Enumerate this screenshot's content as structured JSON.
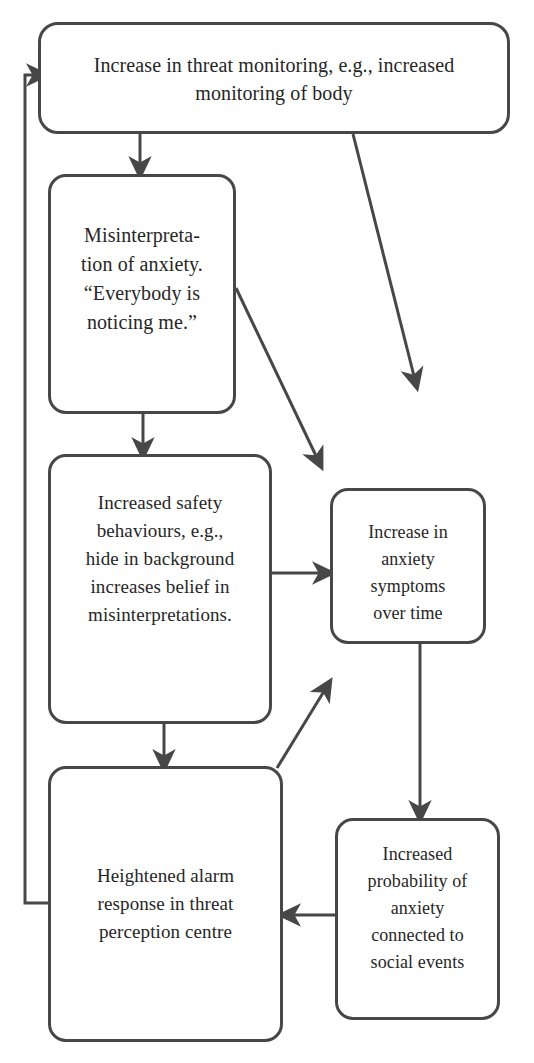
{
  "diagram": {
    "type": "flowchart",
    "line_color": "#474747",
    "text_color": "#262626",
    "background_color": "#ffffff",
    "nodes": [
      {
        "id": "threat-monitoring",
        "label": "Increase in threat monitoring, e.g., increased\nmonitoring of body"
      },
      {
        "id": "misinterpretation",
        "label": "Misinterpreta-\ntion of anxiety.\n“Everybody is\nnoticing me.”"
      },
      {
        "id": "safety-behaviours",
        "label": "Increased safety\nbehaviours, e.g.,\nhide in background\nincreases belief in\nmisinterpretations."
      },
      {
        "id": "anxiety-symptoms",
        "label": "Increase in\nanxiety\nsymptoms\nover time"
      },
      {
        "id": "alarm-response",
        "label": "Heightened alarm\nresponse in threat\nperception centre"
      },
      {
        "id": "anxiety-probability",
        "label": "Increased\nprobability of\nanxiety\nconnected to\nsocial events"
      }
    ],
    "edges": [
      {
        "id": "edge-threat-to-misinterpretation",
        "from": "threat-monitoring",
        "to": "misinterpretation",
        "style": "straight-down"
      },
      {
        "id": "edge-threat-to-diagonal",
        "from": "threat-monitoring",
        "to": "anxiety-symptoms",
        "style": "diagonal-down-right"
      },
      {
        "id": "edge-misinterpretation-to-safety",
        "from": "misinterpretation",
        "to": "safety-behaviours",
        "style": "straight-down"
      },
      {
        "id": "edge-misinterpretation-to-diagonal",
        "from": "misinterpretation",
        "to": "safety-behaviours",
        "style": "diagonal-down-right"
      },
      {
        "id": "edge-safety-to-anxiety-symptoms",
        "from": "safety-behaviours",
        "to": "anxiety-symptoms",
        "style": "straight-right"
      },
      {
        "id": "edge-safety-to-alarm",
        "from": "safety-behaviours",
        "to": "alarm-response",
        "style": "straight-down"
      },
      {
        "id": "edge-anxiety-symptoms-to-probability",
        "from": "anxiety-symptoms",
        "to": "anxiety-probability",
        "style": "straight-down"
      },
      {
        "id": "edge-probability-to-alarm",
        "from": "anxiety-probability",
        "to": "alarm-response",
        "style": "straight-left"
      },
      {
        "id": "edge-alarm-to-safety",
        "from": "alarm-response",
        "to": "safety-behaviours",
        "style": "diagonal-up-right"
      },
      {
        "id": "edge-alarm-to-threat-feedback",
        "from": "alarm-response",
        "to": "threat-monitoring",
        "style": "feedback-loop-left"
      }
    ]
  }
}
